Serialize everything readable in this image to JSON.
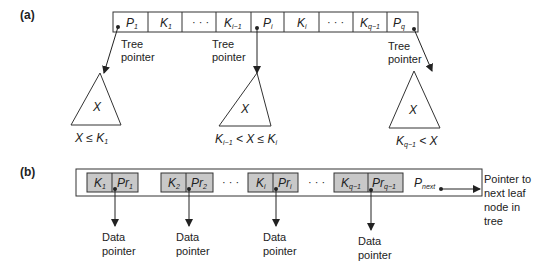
{
  "part_a": {
    "label": "(a)",
    "cells": [
      "P1",
      "K1",
      "...",
      "Ki-1",
      "Pi",
      "Ki",
      "...",
      "Kq-1",
      "Pq"
    ],
    "tree_pointer_label_line1": "Tree",
    "tree_pointer_label_line2": "pointer",
    "subtrees": [
      {
        "symbol": "X",
        "condition": "X ≤ K1"
      },
      {
        "symbol": "X",
        "condition": "Ki-1 < X ≤ Ki"
      },
      {
        "symbol": "X",
        "condition": "Kq-1 < X"
      }
    ]
  },
  "part_b": {
    "label": "(b)",
    "pairs": [
      {
        "key": "K1",
        "ptr": "Pr1"
      },
      {
        "key": "K2",
        "ptr": "Pr2"
      },
      {
        "key": "Ki",
        "ptr": "Pri"
      },
      {
        "key": "Kq-1",
        "ptr": "Prq-1"
      }
    ],
    "ellipsis": "...",
    "next_ptr": "Pnext",
    "data_pointer_line1": "Data",
    "data_pointer_line2": "pointer",
    "next_leaf_text": [
      "Pointer to",
      "next leaf",
      "node in",
      "tree"
    ]
  },
  "colors": {
    "line": "#333333",
    "gray_fill": "#c8c8c8"
  }
}
